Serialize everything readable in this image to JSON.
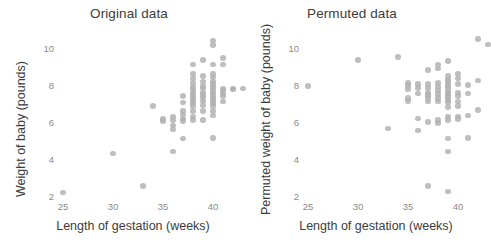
{
  "chart_data": [
    {
      "type": "scatter",
      "title": "Original data",
      "xlabel": "Length of gestation (weeks)",
      "ylabel": "Weight of baby (pounds)",
      "xlim": [
        23.5,
        44.5
      ],
      "ylim": [
        1.5,
        11.0
      ],
      "xticks": [
        25,
        30,
        35,
        40
      ],
      "yticks": [
        2,
        4,
        6,
        8,
        10
      ],
      "grid": false,
      "legend": "none",
      "point_color": "#b0b0b0",
      "points": [
        [
          25,
          2.2
        ],
        [
          30,
          4.3
        ],
        [
          33,
          2.55
        ],
        [
          34,
          6.85
        ],
        [
          35,
          6.15
        ],
        [
          35,
          6.05
        ],
        [
          36,
          6.3
        ],
        [
          36,
          6.1
        ],
        [
          36,
          5.8
        ],
        [
          36,
          5.6
        ],
        [
          36,
          4.4
        ],
        [
          37,
          7.4
        ],
        [
          37,
          7.05
        ],
        [
          37,
          6.6
        ],
        [
          37,
          6.4
        ],
        [
          37,
          6.2
        ],
        [
          37,
          6.05
        ],
        [
          37,
          5.1
        ],
        [
          38,
          9.1
        ],
        [
          38,
          8.6
        ],
        [
          38,
          8.35
        ],
        [
          38,
          8.1
        ],
        [
          38,
          7.9
        ],
        [
          38,
          7.75
        ],
        [
          38,
          7.6
        ],
        [
          38,
          7.45
        ],
        [
          38,
          7.3
        ],
        [
          38,
          7.15
        ],
        [
          38,
          7.0
        ],
        [
          38,
          6.85
        ],
        [
          38,
          6.6
        ],
        [
          38,
          6.3
        ],
        [
          38,
          6.1
        ],
        [
          39,
          9.35
        ],
        [
          39,
          8.5
        ],
        [
          39,
          8.2
        ],
        [
          39,
          7.95
        ],
        [
          39,
          7.8
        ],
        [
          39,
          7.6
        ],
        [
          39,
          7.45
        ],
        [
          39,
          7.3
        ],
        [
          39,
          7.1
        ],
        [
          39,
          6.9
        ],
        [
          39,
          6.6
        ],
        [
          39,
          6.1
        ],
        [
          40,
          10.4
        ],
        [
          40,
          10.15
        ],
        [
          40,
          9.1
        ],
        [
          40,
          8.6
        ],
        [
          40,
          8.4
        ],
        [
          40,
          8.2
        ],
        [
          40,
          8.05
        ],
        [
          40,
          7.9
        ],
        [
          40,
          7.75
        ],
        [
          40,
          7.6
        ],
        [
          40,
          7.45
        ],
        [
          40,
          7.3
        ],
        [
          40,
          7.15
        ],
        [
          40,
          7.0
        ],
        [
          40,
          6.85
        ],
        [
          40,
          6.6
        ],
        [
          40,
          6.35
        ],
        [
          40,
          5.15
        ],
        [
          41,
          9.45
        ],
        [
          41,
          9.1
        ],
        [
          41,
          7.8
        ],
        [
          41,
          7.7
        ],
        [
          41,
          7.55
        ],
        [
          41,
          7.4
        ],
        [
          41,
          7.1
        ],
        [
          42,
          7.8
        ],
        [
          42,
          7.75
        ],
        [
          43,
          7.8
        ]
      ]
    },
    {
      "type": "scatter",
      "title": "Permuted data",
      "xlabel": "Length of gestation (weeks)",
      "ylabel": "Permuted weight of baby (pounds)",
      "xlim": [
        23.5,
        44.5
      ],
      "ylim": [
        1.5,
        11.0
      ],
      "xticks": [
        25,
        30,
        35,
        40
      ],
      "yticks": [
        2,
        4,
        6,
        8,
        10
      ],
      "grid": false,
      "legend": "none",
      "point_color": "#b0b0b0",
      "points": [
        [
          25,
          7.95
        ],
        [
          30,
          9.35
        ],
        [
          33,
          5.65
        ],
        [
          34,
          9.5
        ],
        [
          35,
          8.1
        ],
        [
          35,
          7.95
        ],
        [
          35,
          7.75
        ],
        [
          35,
          7.3
        ],
        [
          35,
          7.15
        ],
        [
          36,
          8.05
        ],
        [
          36,
          7.85
        ],
        [
          36,
          7.55
        ],
        [
          36,
          6.2
        ],
        [
          36,
          5.55
        ],
        [
          37,
          8.8
        ],
        [
          37,
          8.05
        ],
        [
          37,
          7.85
        ],
        [
          37,
          7.6
        ],
        [
          37,
          7.45
        ],
        [
          37,
          7.3
        ],
        [
          37,
          7.1
        ],
        [
          37,
          6.0
        ],
        [
          37,
          2.55
        ],
        [
          38,
          9.1
        ],
        [
          38,
          8.9
        ],
        [
          38,
          8.1
        ],
        [
          38,
          7.9
        ],
        [
          38,
          7.7
        ],
        [
          38,
          7.5
        ],
        [
          38,
          7.3
        ],
        [
          38,
          7.1
        ],
        [
          38,
          6.1
        ],
        [
          38,
          5.95
        ],
        [
          39,
          9.3
        ],
        [
          39,
          8.5
        ],
        [
          39,
          8.3
        ],
        [
          39,
          8.15
        ],
        [
          39,
          8.0
        ],
        [
          39,
          7.85
        ],
        [
          39,
          7.65
        ],
        [
          39,
          7.5
        ],
        [
          39,
          7.35
        ],
        [
          39,
          7.2
        ],
        [
          39,
          7.05
        ],
        [
          39,
          6.8
        ],
        [
          39,
          6.3
        ],
        [
          39,
          6.1
        ],
        [
          39,
          5.1
        ],
        [
          39,
          4.4
        ],
        [
          39,
          2.25
        ],
        [
          40,
          8.6
        ],
        [
          40,
          8.35
        ],
        [
          40,
          8.05
        ],
        [
          40,
          7.6
        ],
        [
          40,
          7.4
        ],
        [
          40,
          7.1
        ],
        [
          40,
          6.85
        ],
        [
          40,
          6.3
        ],
        [
          40,
          6.15
        ],
        [
          41,
          8.0
        ],
        [
          41,
          7.55
        ],
        [
          41,
          6.35
        ],
        [
          41,
          5.15
        ],
        [
          42,
          10.5
        ],
        [
          42,
          8.25
        ],
        [
          42,
          6.65
        ],
        [
          43,
          10.2
        ]
      ]
    }
  ]
}
